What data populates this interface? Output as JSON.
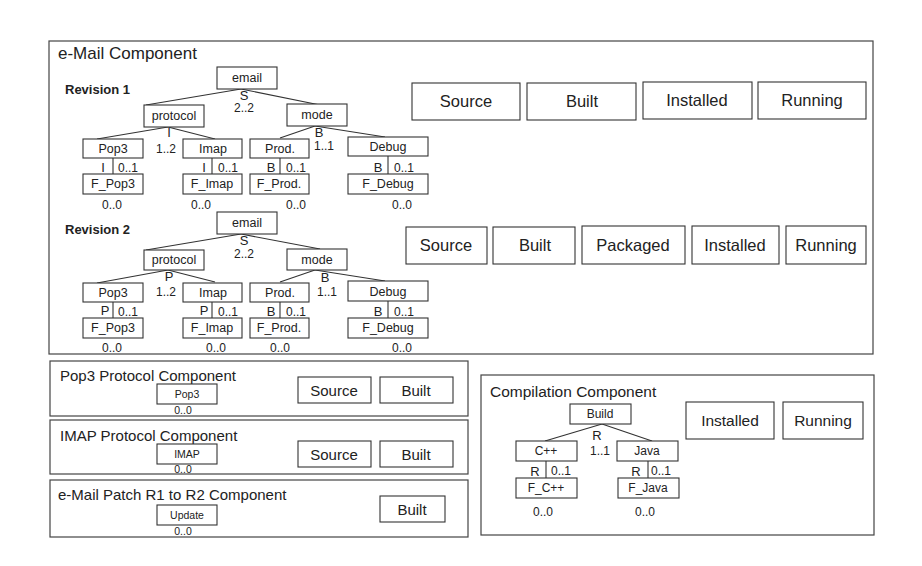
{
  "email_component": {
    "title": "e-Mail Component",
    "revisions": [
      {
        "label": "Revision 1",
        "root": "email",
        "root_rel": "S",
        "root_card": "2..2",
        "protocol": "protocol",
        "protocol_rel": "I",
        "protocol_card": "1..2",
        "mode": "mode",
        "mode_rel": "B",
        "mode_card": "1..1",
        "leaves": [
          {
            "name": "Pop3",
            "rel": "I",
            "card": "0..1",
            "feature": "F_Pop3",
            "feature_card": "0..0"
          },
          {
            "name": "Imap",
            "rel": "I",
            "card": "0..1",
            "feature": "F_Imap",
            "feature_card": "0..0"
          },
          {
            "name": "Prod.",
            "rel": "B",
            "card": "0..1",
            "feature": "F_Prod.",
            "feature_card": "0..0"
          },
          {
            "name": "Debug",
            "rel": "B",
            "card": "0..1",
            "feature": "F_Debug",
            "feature_card": "0..0"
          }
        ],
        "states": [
          "Source",
          "Built",
          "Installed",
          "Running"
        ]
      },
      {
        "label": "Revision 2",
        "root": "email",
        "root_rel": "S",
        "root_card": "2..2",
        "protocol": "protocol",
        "protocol_rel": "P",
        "protocol_card": "1..2",
        "mode": "mode",
        "mode_rel": "B",
        "mode_card": "1..1",
        "leaves": [
          {
            "name": "Pop3",
            "rel": "P",
            "card": "0..1",
            "feature": "F_Pop3",
            "feature_card": "0..0"
          },
          {
            "name": "Imap",
            "rel": "P",
            "card": "0..1",
            "feature": "F_Imap",
            "feature_card": "0..0"
          },
          {
            "name": "Prod.",
            "rel": "B",
            "card": "0..1",
            "feature": "F_Prod.",
            "feature_card": "0..0"
          },
          {
            "name": "Debug",
            "rel": "B",
            "card": "0..1",
            "feature": "F_Debug",
            "feature_card": "0..0"
          }
        ],
        "states": [
          "Source",
          "Built",
          "Packaged",
          "Installed",
          "Running"
        ]
      }
    ]
  },
  "pop3_component": {
    "title": "Pop3 Protocol Component",
    "node": "Pop3",
    "card": "0..0",
    "states": [
      "Source",
      "Built"
    ]
  },
  "imap_component": {
    "title": "IMAP Protocol Component",
    "node": "IMAP",
    "card": "0..0",
    "states": [
      "Source",
      "Built"
    ]
  },
  "patch_component": {
    "title": "e-Mail Patch R1 to R2 Component",
    "node": "Update",
    "card": "0..0",
    "states": [
      "Built"
    ]
  },
  "compilation_component": {
    "title": "Compilation Component",
    "root": "Build",
    "root_rel": "R",
    "root_card": "1..1",
    "leaves": [
      {
        "name": "C++",
        "rel": "R",
        "card": "0..1",
        "feature": "F_C++",
        "feature_card": "0..0"
      },
      {
        "name": "Java",
        "rel": "R",
        "card": "0..1",
        "feature": "F_Java",
        "feature_card": "0..0"
      }
    ],
    "states": [
      "Installed",
      "Running"
    ]
  }
}
